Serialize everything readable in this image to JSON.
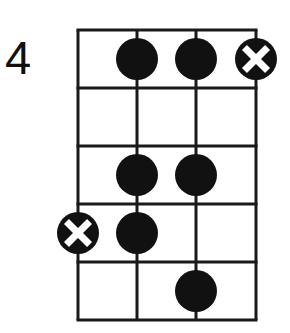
{
  "diagram": {
    "type": "chord-box",
    "fret_label": "4",
    "strings": 4,
    "frets": 5,
    "grid": {
      "string_x": [
        78,
        137,
        196,
        256
      ],
      "fret_y": [
        30,
        88,
        146,
        204,
        262,
        320
      ],
      "line_color": "#1a1a1a",
      "line_width": 3
    },
    "dot_radius": 21,
    "dot_color": "#111111",
    "markers": [
      {
        "fret": 1,
        "string": 2,
        "kind": "dot"
      },
      {
        "fret": 1,
        "string": 3,
        "kind": "dot"
      },
      {
        "fret": 1,
        "string": 4,
        "kind": "root-x"
      },
      {
        "fret": 3,
        "string": 2,
        "kind": "dot"
      },
      {
        "fret": 3,
        "string": 3,
        "kind": "dot"
      },
      {
        "fret": 4,
        "string": 1,
        "kind": "root-x"
      },
      {
        "fret": 4,
        "string": 2,
        "kind": "dot"
      },
      {
        "fret": 5,
        "string": 3,
        "kind": "dot"
      }
    ]
  }
}
